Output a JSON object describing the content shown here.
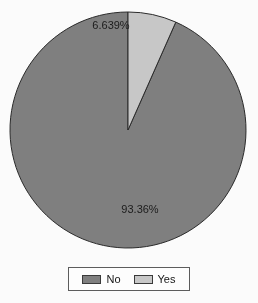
{
  "chart_data": {
    "type": "pie",
    "title": "",
    "subtitle": "",
    "xlabel": "",
    "ylabel": "",
    "grid": false,
    "legend_position": "bottom",
    "categories": [
      "No",
      "Yes"
    ],
    "values": [
      93.36,
      6.639
    ],
    "slices": [
      {
        "name": "No",
        "value": 93.36,
        "label": "93.36%",
        "color": "#808080",
        "label_x": 140,
        "label_y": 213
      },
      {
        "name": "Yes",
        "value": 6.639,
        "label": "6.639%",
        "color": "#c9c9c9",
        "label_x": 111,
        "label_y": 29
      }
    ],
    "colors": {
      "no": "#808080",
      "yes": "#c9c9c9",
      "outline": "#2b2b2b",
      "background": "#fdfdfd",
      "label_text": "#1b1b1b"
    },
    "geometry": {
      "center_x": 128,
      "center_y": 130,
      "radius": 118,
      "start_angle_deg": 90,
      "direction": "counterclockwise"
    }
  },
  "legend": {
    "entries": [
      {
        "label": "No",
        "color": "#808080"
      },
      {
        "label": "Yes",
        "color": "#c9c9c9"
      }
    ]
  }
}
